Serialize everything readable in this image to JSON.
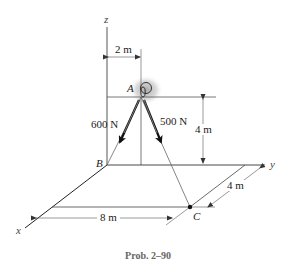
{
  "figure": {
    "caption": "Prob. 2–90",
    "axes": {
      "x_label": "x",
      "y_label": "y",
      "z_label": "z"
    },
    "points": {
      "A": "A",
      "B": "B",
      "C": "C"
    },
    "forces": [
      {
        "label": "600 N",
        "direction": "A to B"
      },
      {
        "label": "500 N",
        "direction": "A to C"
      }
    ],
    "dimensions": {
      "a_offset_y": "2 m",
      "a_height": "4 m",
      "c_offset_y": "4 m",
      "c_offset_x": "8 m"
    },
    "colors": {
      "line": "#222222",
      "thin_line": "#555555",
      "highlight": "#bdbdbd"
    }
  }
}
